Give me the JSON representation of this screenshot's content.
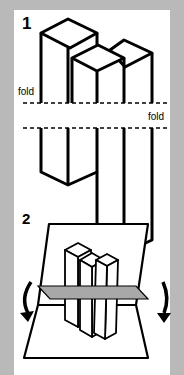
{
  "steps": [
    {
      "number": "1",
      "description": "three isometric columns with two horizontal fold lines"
    },
    {
      "number": "2",
      "description": "paper folded along crease with arrows pointing down on both sides"
    }
  ],
  "labels": {
    "fold_left": "fold",
    "fold_right": "fold"
  },
  "colors": {
    "background": "#b9b9b9",
    "panel": "#ffffff",
    "stroke": "#000000",
    "crease": "#a8a8a8"
  }
}
